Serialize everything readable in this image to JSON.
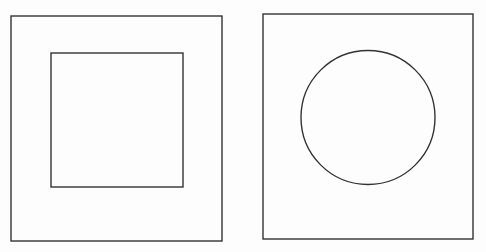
{
  "canvas": {
    "width": 486,
    "height": 252,
    "background": "#fdfdfd"
  },
  "stroke": {
    "color": "#333333",
    "width": 1.4
  },
  "figures": [
    {
      "name": "square-in-square",
      "outer": {
        "x": 11,
        "y": 16,
        "w": 211,
        "h": 225
      },
      "inner": {
        "shape": "square",
        "x": 51,
        "y": 53,
        "w": 132,
        "h": 134
      }
    },
    {
      "name": "circle-in-square",
      "outer": {
        "x": 263,
        "y": 14,
        "w": 210,
        "h": 225
      },
      "inner": {
        "shape": "circle",
        "cx": 368,
        "cy": 117.5,
        "r": 67
      }
    }
  ]
}
